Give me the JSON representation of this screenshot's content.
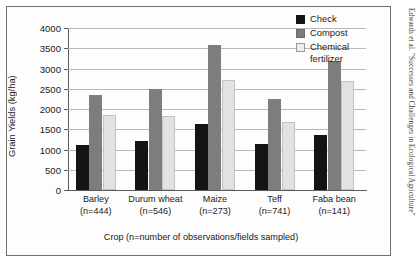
{
  "running_head": "Edwards et al. \"Successes and Challenges in Ecological Agriculture\"",
  "chart_data": {
    "type": "bar",
    "title": "",
    "xlabel": "Crop (n=number of observations/fields sampled)",
    "ylabel": "Grain Yields (kg/ha)",
    "ylim": [
      0,
      4000
    ],
    "ytick_step": 500,
    "yticks": [
      4000,
      3500,
      3000,
      2500,
      2000,
      1500,
      1000,
      500,
      0
    ],
    "ytick_labels": [
      "4000",
      "3500",
      "3000",
      "2500",
      "2000",
      "1500",
      "1000",
      "500",
      "0"
    ],
    "grid": true,
    "legend_position": "top-right",
    "categories": [
      "Barley",
      "Durum wheat",
      "Maize",
      "Teff",
      "Faba bean"
    ],
    "category_n": [
      "(n=444)",
      "(n=546)",
      "(n=273)",
      "(n=741)",
      "(n=141)"
    ],
    "series": [
      {
        "name": "Check",
        "color": "#141414",
        "values": [
          1120,
          1220,
          1640,
          1130,
          1370
        ]
      },
      {
        "name": "Compost",
        "color": "#7d7d7d",
        "values": [
          2340,
          2500,
          3570,
          2250,
          3180
        ]
      },
      {
        "name": "Chemical fertilizer",
        "color": "#e2e2e2",
        "values": [
          1840,
          1820,
          2720,
          1690,
          2680
        ]
      }
    ]
  },
  "legend": {
    "items": [
      {
        "label": "Check",
        "label2": ""
      },
      {
        "label": "Compost",
        "label2": ""
      },
      {
        "label": "Chemical",
        "label2": "fertilizer"
      }
    ]
  }
}
